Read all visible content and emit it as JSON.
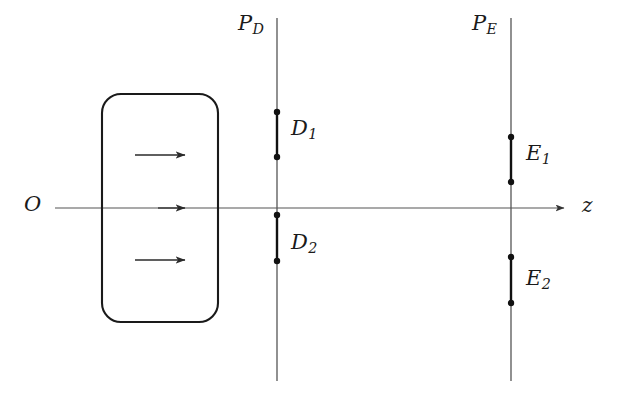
{
  "figure": {
    "kind": "optics-ray-diagram",
    "background_color": "#ffffff",
    "stroke_color": "#1a1a1a",
    "axis_color": "#555555",
    "labels": {
      "origin": "O",
      "axis": "z",
      "plane_d_prefix": "P",
      "plane_d_sub": "D",
      "plane_e_prefix": "P",
      "plane_e_sub": "E",
      "object_1_prefix": "D",
      "object_1_sub": "1",
      "object_2_prefix": "D",
      "object_2_sub": "2",
      "image_1_prefix": "E",
      "image_1_sub": "1",
      "image_2_prefix": "E",
      "image_2_sub": "2"
    },
    "geometry": {
      "optical_axis": {
        "x1": 55,
        "y": 208,
        "x2": 572
      },
      "axis_arrow_tip_x": 572,
      "lens_box": {
        "x": 102,
        "y": 94,
        "width": 116,
        "height": 228,
        "radius": 19
      },
      "internal_arrows": [
        {
          "name": "upper-field-arrow",
          "x1": 135,
          "y": 155,
          "x2": 191
        },
        {
          "name": "axial-field-arrow",
          "x1": 158,
          "y": 208,
          "x2": 191
        },
        {
          "name": "lower-field-arrow",
          "x1": 135,
          "y": 260,
          "x2": 191
        }
      ],
      "plane_d": {
        "x": 277,
        "y_top": 18,
        "y_bottom": 381
      },
      "plane_e": {
        "x": 511,
        "y_top": 18,
        "y_bottom": 381
      },
      "segments": [
        {
          "name": "segment-d1",
          "x": 277,
          "y1": 112,
          "y2": 157
        },
        {
          "name": "segment-d2",
          "x": 277,
          "y1": 215,
          "y2": 261
        },
        {
          "name": "segment-e1",
          "x": 511,
          "y1": 137,
          "y2": 182
        },
        {
          "name": "segment-e2",
          "x": 511,
          "y1": 257,
          "y2": 303
        }
      ],
      "endpoint_dot_radius": 3.2
    },
    "label_positions": {
      "origin": {
        "x": 24,
        "y": 194
      },
      "axis": {
        "x": 582,
        "y": 195
      },
      "plane_d": {
        "x": 238,
        "y": 13
      },
      "plane_e": {
        "x": 472,
        "y": 13
      },
      "object_1": {
        "x": 291,
        "y": 118
      },
      "object_2": {
        "x": 291,
        "y": 232
      },
      "image_1": {
        "x": 526,
        "y": 143
      },
      "image_2": {
        "x": 526,
        "y": 268
      }
    }
  }
}
